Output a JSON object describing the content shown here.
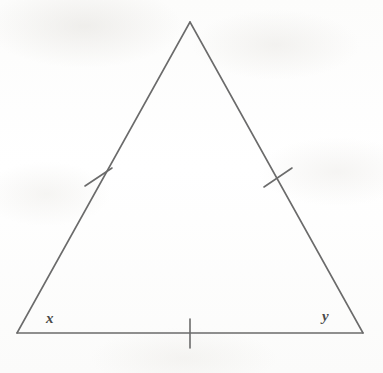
{
  "figure": {
    "kind": "isosceles-triangle",
    "background_color": "#fdfdfc",
    "stroke_color": "#6b6b6b",
    "label_color": "#4a4a4a",
    "stroke_width": 1.6,
    "canvas": {
      "width": 383,
      "height": 373
    }
  },
  "vertices": {
    "apex": {
      "name": "apex",
      "x": 190,
      "y": 22
    },
    "bottom_left": {
      "name": "bottom-left",
      "x": 17,
      "y": 333
    },
    "bottom_right": {
      "name": "bottom-right",
      "x": 363,
      "y": 333
    }
  },
  "sides": [
    {
      "name": "left-leg",
      "from": "apex",
      "to": "bottom_left",
      "tick_count": 1
    },
    {
      "name": "right-leg",
      "from": "apex",
      "to": "bottom_right",
      "tick_count": 1
    },
    {
      "name": "base",
      "from": "bottom_left",
      "to": "bottom_right",
      "tick_count": 1
    }
  ],
  "tick_marks": [
    {
      "name": "left-leg-tick",
      "cx": 98,
      "cy": 177,
      "x1": 85,
      "y1": 186,
      "x2": 112,
      "y2": 168
    },
    {
      "name": "right-leg-tick",
      "cx": 277,
      "cy": 177,
      "x1": 264,
      "y1": 187,
      "x2": 292,
      "y2": 168
    },
    {
      "name": "base-tick",
      "cx": 190,
      "cy": 333,
      "x1": 190,
      "y1": 319,
      "x2": 190,
      "y2": 348
    }
  ],
  "labels": {
    "angle_x": {
      "text": "x",
      "x": 46,
      "y": 311
    },
    "angle_y": {
      "text": "y",
      "x": 322,
      "y": 309
    }
  }
}
